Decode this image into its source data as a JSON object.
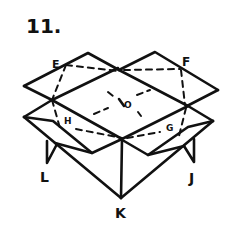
{
  "diagram": {
    "step_number": "11.",
    "labels": {
      "E": "E",
      "F": "F",
      "O": "O",
      "H": "H",
      "G": "G",
      "L": "L",
      "J": "J",
      "K": "K"
    },
    "stroke_color": "#111111",
    "background": "#ffffff"
  }
}
